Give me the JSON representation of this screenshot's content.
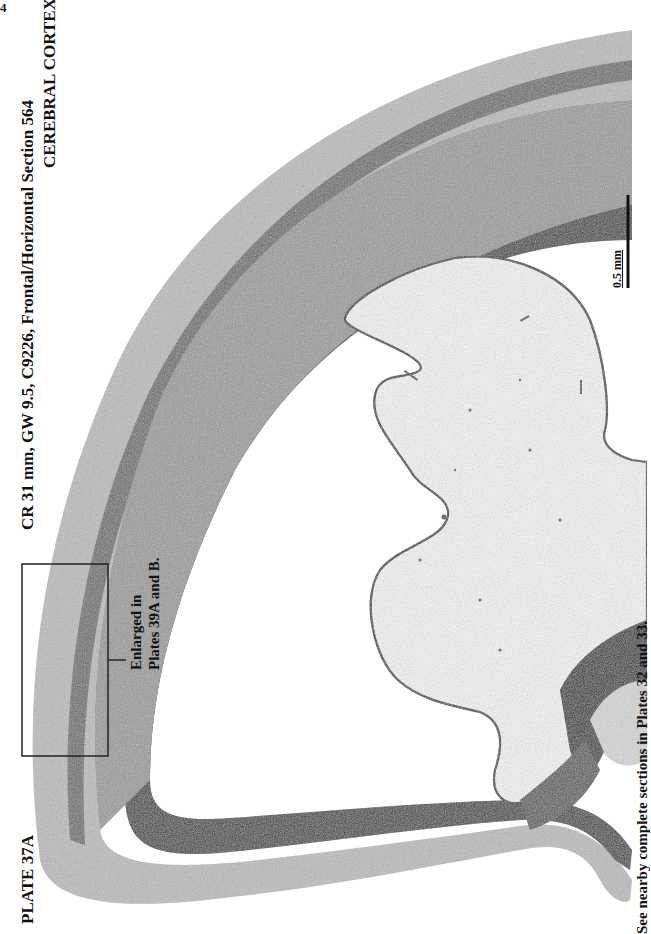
{
  "page": {
    "page_number": "4",
    "plate_label": "PLATE 37A",
    "title": "CR 31 mm, GW 9.5, C9226, Frontal/Horizontal Section 564",
    "subtitle": "CEREBRAL CORTEX",
    "scale_bar": {
      "label": "0.5 mm"
    },
    "callout": {
      "line1": "Enlarged in",
      "line2": "Plates 39A and B."
    },
    "footer_note": "See nearby complete sections in Plates 32 and 33."
  },
  "colors": {
    "ink": "#111111",
    "tissue_dark": "#2a2a2a",
    "tissue_mid": "#7a7a7a",
    "tissue_light": "#c8c8c8",
    "background": "#ffffff"
  }
}
